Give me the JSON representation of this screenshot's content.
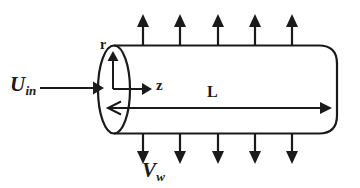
{
  "figure": {
    "kind": "engineering-schematic",
    "background_color": "#ffffff",
    "line_color": "#1a1a1a"
  },
  "labels": {
    "inlet_velocity": {
      "base": "U",
      "subscript": "in",
      "name": "inlet-velocity-label"
    },
    "wall_velocity": {
      "base": "V",
      "subscript": "w",
      "name": "wall-velocity-label"
    },
    "radial_axis": "r",
    "axial_axis": "z",
    "length": "L"
  },
  "geometry": {
    "tube": {
      "left_cap_center_x": 114,
      "left_cap_center_y": 89.5,
      "cap_rx": 16,
      "cap_ry": 44,
      "top_edge_y": 45.5,
      "bottom_edge_y": 133.5,
      "right_x": 337,
      "right_cap_radius": 18
    },
    "axis_origin": {
      "x": 113,
      "y": 89
    },
    "radial_axis_tip_y": 54,
    "axial_axis_tip_x": 150,
    "inlet_arrow": {
      "x_start": 40,
      "x_end": 99,
      "y": 88
    },
    "length_arrow": {
      "x_left": 108,
      "x_right": 330,
      "y": 108
    }
  },
  "flux_arrows": {
    "top": {
      "count": 5,
      "x_positions": [
        143,
        180,
        218,
        255,
        292
      ],
      "y_base": 45.5,
      "y_tip": 18
    },
    "bottom": {
      "count": 5,
      "x_positions": [
        143,
        180,
        218,
        255,
        292
      ],
      "y_base": 133.5,
      "y_tip": 161
    }
  }
}
